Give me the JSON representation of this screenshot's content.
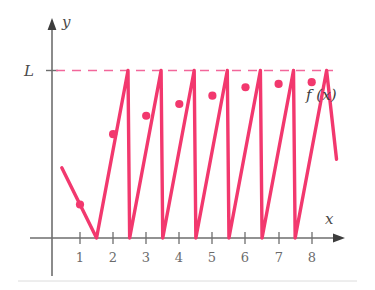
{
  "figure": {
    "title": "",
    "function_label": "f (x)",
    "limit_label": "L",
    "x_axis_label": "x",
    "y_axis_label": "y"
  },
  "colors": {
    "curve": "#F2386E",
    "dashed_limit": "#F2679B",
    "axis": "#6e6e6e",
    "tick_text": "#6b6b6b",
    "label_text": "#4a4a4a",
    "background": "#ffffff",
    "footer_rule": "#d9d9d9"
  },
  "chart_data": {
    "type": "line",
    "title": "",
    "xlabel": "x",
    "ylabel": "y",
    "grid": false,
    "legend": "none",
    "xlim": [
      0,
      9.2
    ],
    "ylim": [
      0,
      1.18
    ],
    "limit_value": "L",
    "limit_y": 1.0,
    "annotations": [
      {
        "text": "L",
        "x": -0.45,
        "y": 1.0,
        "note": "limit level label on y-axis"
      },
      {
        "text": "f (x)",
        "x": 8.55,
        "y": 0.83,
        "note": "curve name label at right"
      },
      {
        "text": "x",
        "x": 8.95,
        "y": 0.13,
        "note": "x-axis name"
      },
      {
        "text": "y",
        "x": 0.3,
        "y": 1.17,
        "note": "y-axis name"
      }
    ],
    "x_ticks": [
      1,
      2,
      3,
      4,
      5,
      6,
      7,
      8
    ],
    "x_tick_labels": [
      "1",
      "2",
      "3",
      "4",
      "5",
      "6",
      "7",
      "8"
    ],
    "y_ticks": [
      1.0
    ],
    "y_tick_labels": [
      "L"
    ],
    "series": [
      {
        "name": "f(x)",
        "kind": "polyline",
        "x": [
          0.45,
          1.0,
          1.5,
          2.45,
          2.5,
          3.45,
          3.5,
          4.45,
          4.5,
          5.45,
          5.5,
          6.45,
          6.5,
          7.45,
          7.5,
          8.45,
          8.75
        ],
        "y": [
          0.42,
          0.2,
          0.0,
          1.0,
          0.0,
          1.0,
          0.0,
          1.0,
          0.0,
          1.0,
          0.0,
          1.0,
          0.0,
          1.0,
          0.0,
          1.0,
          0.47
        ],
        "comment": "vertex list of the sawtooth: start, first descent to zero, then rising ramps to L at x=2.45,3.45,... each followed by a fast drop to 0"
      }
    ],
    "points": [
      {
        "label": "",
        "x": 1,
        "y": 0.2
      },
      {
        "label": "",
        "x": 2,
        "y": 0.62
      },
      {
        "label": "",
        "x": 3,
        "y": 0.73
      },
      {
        "label": "",
        "x": 4,
        "y": 0.8
      },
      {
        "label": "",
        "x": 5,
        "y": 0.85
      },
      {
        "label": "",
        "x": 6,
        "y": 0.9
      },
      {
        "label": "",
        "x": 7,
        "y": 0.92
      },
      {
        "label": "",
        "x": 8,
        "y": 0.93
      }
    ],
    "point_note": "marked sample points f(n) at integer x, approaching L"
  }
}
